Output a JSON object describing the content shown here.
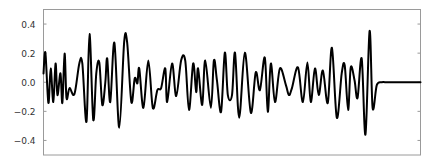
{
  "chart_data": {
    "type": "line",
    "title": "",
    "xlabel": "",
    "ylabel": "",
    "ylim": [
      -0.5,
      0.5
    ],
    "xlim": [
      0,
      1
    ],
    "grid": false,
    "legend": null,
    "yticks": [
      0.4,
      0.2,
      0.0,
      -0.2,
      -0.4
    ],
    "ytick_labels": [
      "0.4",
      "0.2",
      "0.0",
      "−0.2",
      "−0.4"
    ],
    "xticks": [],
    "line_color": "#000000",
    "line_width": 2,
    "series": [
      {
        "name": "signal",
        "x": [
          0.0,
          0.005,
          0.013,
          0.019,
          0.026,
          0.032,
          0.037,
          0.045,
          0.05,
          0.056,
          0.061,
          0.069,
          0.082,
          0.095,
          0.103,
          0.114,
          0.122,
          0.132,
          0.14,
          0.148,
          0.156,
          0.164,
          0.169,
          0.177,
          0.188,
          0.201,
          0.214,
          0.222,
          0.233,
          0.242,
          0.249,
          0.254,
          0.265,
          0.278,
          0.29,
          0.302,
          0.312,
          0.323,
          0.328,
          0.341,
          0.352,
          0.365,
          0.376,
          0.386,
          0.397,
          0.405,
          0.41,
          0.421,
          0.429,
          0.444,
          0.452,
          0.46,
          0.471,
          0.481,
          0.489,
          0.5,
          0.508,
          0.519,
          0.534,
          0.55,
          0.563,
          0.574,
          0.587,
          0.595,
          0.603,
          0.614,
          0.627,
          0.643,
          0.651,
          0.659,
          0.675,
          0.688,
          0.7,
          0.709,
          0.72,
          0.73,
          0.741,
          0.754,
          0.765,
          0.778,
          0.791,
          0.799,
          0.808,
          0.815,
          0.825,
          0.833,
          0.844,
          0.854,
          0.865,
          0.873,
          0.884,
          0.897,
          0.91,
          0.921,
          0.929,
          0.939,
          0.95,
          0.963,
          0.976,
          0.988,
          1.0
        ],
        "y": [
          0.06,
          0.203,
          -0.142,
          0.095,
          -0.136,
          0.129,
          -0.088,
          0.061,
          -0.142,
          0.197,
          -0.108,
          -0.04,
          -0.082,
          0.129,
          0.129,
          -0.271,
          0.332,
          -0.258,
          0.061,
          0.136,
          -0.156,
          0.0,
          0.163,
          -0.136,
          0.271,
          -0.312,
          0.278,
          0.271,
          -0.136,
          0.027,
          -0.007,
          0.095,
          -0.176,
          0.149,
          -0.176,
          -0.054,
          -0.04,
          0.095,
          -0.136,
          0.129,
          -0.095,
          0.149,
          0.149,
          -0.19,
          0.129,
          -0.068,
          0.095,
          -0.156,
          0.149,
          -0.176,
          0.149,
          0.014,
          -0.203,
          0.203,
          -0.088,
          -0.088,
          0.203,
          -0.244,
          0.203,
          -0.21,
          0.068,
          -0.054,
          0.169,
          -0.203,
          0.129,
          -0.136,
          0.095,
          -0.02,
          -0.088,
          -0.04,
          0.102,
          -0.136,
          0.136,
          -0.136,
          0.095,
          -0.088,
          0.081,
          -0.142,
          0.237,
          -0.244,
          0.061,
          0.115,
          -0.19,
          0.102,
          0.014,
          -0.108,
          0.163,
          -0.359,
          0.352,
          -0.176,
          -0.02,
          0.0,
          0.0,
          0.0,
          0.0,
          0.0,
          0.0,
          0.0,
          0.0,
          0.0,
          0.0
        ]
      }
    ]
  }
}
